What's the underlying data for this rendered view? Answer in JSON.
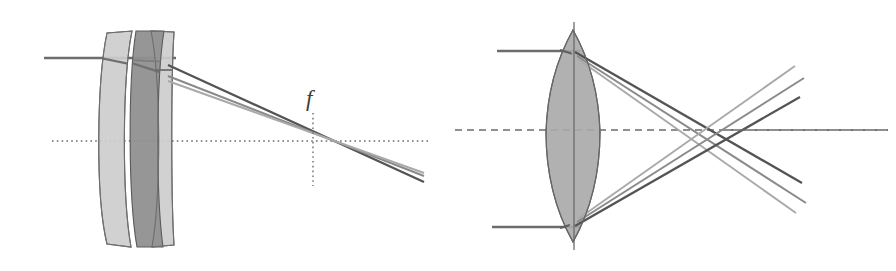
{
  "figure": {
    "background_color": "#ffffff",
    "width": 896,
    "height": 271,
    "panel_count": 2
  },
  "annotations": [
    {
      "name": "focal-length-label",
      "text": "f",
      "x": 313,
      "y": 104,
      "style": "italic-serif"
    }
  ],
  "colors": {
    "glass_light": "#c9c9c9",
    "glass_light_stroke": "#6e6e6e",
    "glass_dark": "#8f8f8f",
    "glass_dark_stroke": "#5a5a5a",
    "glass_mid": "#a8a8a8",
    "glass_mid_stroke": "#666666",
    "ray_dark": "#545454",
    "ray_mid": "#7d7d7d",
    "ray_light": "#a2a2a2",
    "axis": "#6b6b6b",
    "label": "#3c3c3c"
  },
  "left_panel": {
    "name": "triplet-lens-panel",
    "description": "Cemented triplet / airspaced group with off-axis collimated beam focusing to focal plane",
    "axis": {
      "name": "optical-axis",
      "style": "dotted",
      "x1": 52,
      "x2": 430,
      "y": 141
    },
    "focal_marker": {
      "name": "focal-plane-line",
      "style": "dotted",
      "x": 313,
      "y1": 114,
      "y2": 185
    },
    "elements": [
      {
        "name": "lens-element-1",
        "type": "meniscus",
        "shade": "glass_light"
      },
      {
        "name": "lens-element-2",
        "type": "biconcave",
        "shade": "glass_dark"
      },
      {
        "name": "lens-element-3",
        "type": "meniscus",
        "shade": "glass_light"
      }
    ],
    "rays": [
      {
        "name": "ray-upper",
        "shade": "ray_dark"
      },
      {
        "name": "ray-middle",
        "shade": "ray_mid"
      },
      {
        "name": "ray-lower",
        "shade": "ray_light"
      }
    ],
    "incoming_beam": {
      "x_start": 44,
      "y": 58,
      "orientation": "horizontal"
    }
  },
  "right_panel": {
    "name": "biconvex-lens-panel",
    "description": "Single biconvex lens with two marginal collimated beams crossing past focus",
    "axis": {
      "name": "optical-axis",
      "style": "dashed",
      "x1": 455,
      "x2": 888,
      "y": 130
    },
    "optical_center_line": {
      "name": "lens-center-line",
      "style": "solid",
      "x": 574,
      "y1": 22,
      "y2": 248
    },
    "elements": [
      {
        "name": "lens-element-1",
        "type": "biconvex",
        "shade": "glass_mid"
      }
    ],
    "rays": [
      {
        "name": "ray-upper-dark",
        "shade": "ray_dark"
      },
      {
        "name": "ray-upper-mid",
        "shade": "ray_mid"
      },
      {
        "name": "ray-upper-light",
        "shade": "ray_light"
      },
      {
        "name": "ray-lower-dark",
        "shade": "ray_dark"
      },
      {
        "name": "ray-lower-mid",
        "shade": "ray_mid"
      },
      {
        "name": "ray-lower-light",
        "shade": "ray_light"
      }
    ],
    "incoming_beams": [
      {
        "name": "upper-beam",
        "x_start": 497,
        "y": 51,
        "orientation": "horizontal"
      },
      {
        "name": "lower-beam",
        "x_start": 492,
        "y": 227,
        "orientation": "horizontal"
      }
    ],
    "crossing_point": {
      "x": 722,
      "y": 129
    }
  }
}
